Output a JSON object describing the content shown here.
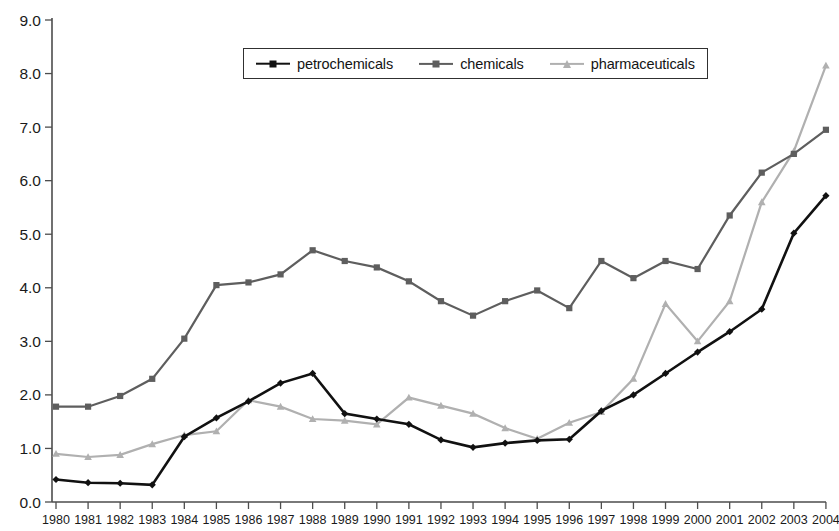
{
  "legend": {
    "position": "top-center",
    "items": [
      {
        "label": "petrochemicals",
        "color": "#111111",
        "marker": "diamond"
      },
      {
        "label": "chemicals",
        "color": "#5e5e5e",
        "marker": "square"
      },
      {
        "label": "pharmaceuticals",
        "color": "#b0b0b0",
        "marker": "triangle"
      }
    ]
  },
  "axes": {
    "y_ticks": [
      "0.0",
      "1.0",
      "2.0",
      "3.0",
      "4.0",
      "5.0",
      "6.0",
      "7.0",
      "8.0",
      "9.0"
    ],
    "x_ticks": [
      "1980",
      "1981",
      "1982",
      "1983",
      "1984",
      "1985",
      "1986",
      "1987",
      "1988",
      "1989",
      "1990",
      "1991",
      "1992",
      "1993",
      "1994",
      "1995",
      "1996",
      "1997",
      "1998",
      "1999",
      "2000",
      "2001",
      "2002",
      "2003",
      "2004"
    ]
  },
  "chart_data": {
    "type": "line",
    "title": "",
    "subtitle": "",
    "xlabel": "",
    "ylabel": "",
    "grid": false,
    "legend_position": "top-center",
    "xlim": [
      1980,
      2004
    ],
    "ylim": [
      0.0,
      9.0
    ],
    "ytick_step": 1.0,
    "categories": [
      1980,
      1981,
      1982,
      1983,
      1984,
      1985,
      1986,
      1987,
      1988,
      1989,
      1990,
      1991,
      1992,
      1993,
      1994,
      1995,
      1996,
      1997,
      1998,
      1999,
      2000,
      2001,
      2002,
      2003,
      2004
    ],
    "series": [
      {
        "name": "petrochemicals",
        "color": "#111111",
        "marker": "diamond",
        "values": [
          0.42,
          0.36,
          0.35,
          0.32,
          1.22,
          1.57,
          1.88,
          2.22,
          2.4,
          1.65,
          1.55,
          1.45,
          1.16,
          1.02,
          1.1,
          1.15,
          1.17,
          1.7,
          2.0,
          2.4,
          2.8,
          3.18,
          3.6,
          5.02,
          5.72
        ]
      },
      {
        "name": "chemicals",
        "color": "#5e5e5e",
        "marker": "square",
        "values": [
          1.78,
          1.78,
          1.98,
          2.3,
          3.05,
          4.05,
          4.1,
          4.25,
          4.7,
          4.5,
          4.38,
          4.12,
          3.75,
          3.48,
          3.75,
          3.95,
          3.62,
          4.5,
          4.18,
          4.5,
          4.35,
          5.35,
          6.15,
          6.5,
          6.95
        ]
      },
      {
        "name": "pharmaceuticals",
        "color": "#b0b0b0",
        "marker": "triangle",
        "values": [
          0.9,
          0.84,
          0.88,
          1.08,
          1.25,
          1.32,
          1.9,
          1.78,
          1.55,
          1.52,
          1.45,
          1.95,
          1.8,
          1.65,
          1.38,
          1.18,
          1.48,
          1.68,
          2.3,
          3.7,
          3.0,
          3.75,
          5.6,
          6.55,
          8.15
        ]
      }
    ]
  }
}
